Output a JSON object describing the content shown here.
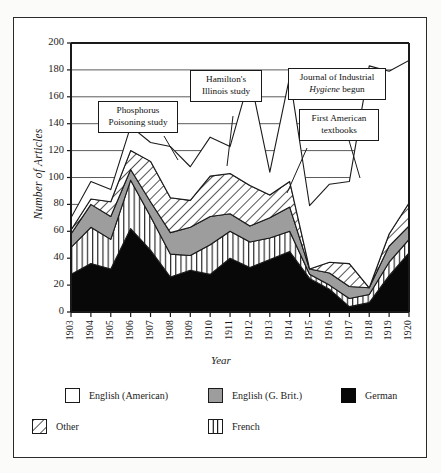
{
  "figure": {
    "y_axis_title": "Number of Articles",
    "x_axis_title": "Year"
  },
  "axes": {
    "y_ticks": [
      "0",
      "20",
      "40",
      "60",
      "80",
      "100",
      "120",
      "140",
      "160",
      "180",
      "200"
    ],
    "x_ticks": [
      "1903",
      "1904",
      "1905",
      "1906",
      "1907",
      "1908",
      "1909",
      "1910",
      "1911",
      "1912",
      "1913",
      "1914",
      "1915",
      "1916",
      "1917",
      "1918",
      "1919",
      "1920"
    ]
  },
  "annotations": [
    {
      "id": "phosphorus",
      "line1": "Phosphorus",
      "line2": "Poisoning study"
    },
    {
      "id": "hamilton",
      "line1": "Hamilton's",
      "line2": "Illinois study"
    },
    {
      "id": "journal",
      "line1": "Journal of Industrial",
      "line2a": "Hygiene",
      "line2b": " begun"
    },
    {
      "id": "textbooks",
      "line1": "First American",
      "line2": "textbooks"
    }
  ],
  "legend": {
    "entries": [
      {
        "label": "English (American)",
        "swatch": "white"
      },
      {
        "label": "English (G. Brit.)",
        "swatch": "gray"
      },
      {
        "label": "German",
        "swatch": "black"
      },
      {
        "label": "Other",
        "swatch": "hatch"
      },
      {
        "label": "French",
        "swatch": "vertical"
      }
    ]
  },
  "colors": {
    "german": "#080808",
    "english_gb": "#9d9d9d",
    "english_am": "#ffffff",
    "line": "#1a1a1a",
    "grid": "#4a4a4a",
    "frame": "#2b2b2b"
  },
  "chart_data": {
    "type": "area",
    "stacked": true,
    "title": "",
    "xlabel": "Year",
    "ylabel": "Number of Articles",
    "ylim": [
      0,
      200
    ],
    "grid": true,
    "legend_position": "bottom",
    "x": [
      1903,
      1904,
      1905,
      1906,
      1907,
      1908,
      1909,
      1910,
      1911,
      1912,
      1913,
      1914,
      1915,
      1916,
      1917,
      1918,
      1919,
      1920
    ],
    "stack_order": [
      "German",
      "French",
      "English (G. Brit.)",
      "Other",
      "English (American)"
    ],
    "series": [
      {
        "name": "German",
        "values": [
          28,
          36,
          32,
          62,
          46,
          26,
          31,
          28,
          40,
          33,
          39,
          45,
          25,
          17,
          4,
          7,
          27,
          44
        ]
      },
      {
        "name": "French",
        "values": [
          20,
          27,
          22,
          36,
          25,
          17,
          11,
          22,
          20,
          19,
          16,
          15,
          3,
          3,
          6,
          6,
          10,
          10
        ]
      },
      {
        "name": "English (G. Brit.)",
        "values": [
          10,
          17,
          17,
          8,
          11,
          16,
          21,
          21,
          13,
          12,
          15,
          18,
          4,
          9,
          9,
          5,
          12,
          10
        ]
      },
      {
        "name": "Other",
        "values": [
          3,
          4,
          11,
          14,
          30,
          26,
          20,
          30,
          30,
          30,
          17,
          19,
          0,
          8,
          17,
          0,
          9,
          17
        ]
      },
      {
        "name": "English (American)",
        "values": [
          9,
          13,
          9,
          18,
          14,
          38,
          25,
          29,
          20,
          81,
          17,
          78,
          47,
          58,
          61,
          165,
          121,
          106
        ]
      }
    ],
    "totals": [
      70,
      97,
      91,
      138,
      126,
      123,
      108,
      130,
      123,
      175,
      104,
      175,
      79,
      95,
      97,
      183,
      179,
      187
    ]
  }
}
